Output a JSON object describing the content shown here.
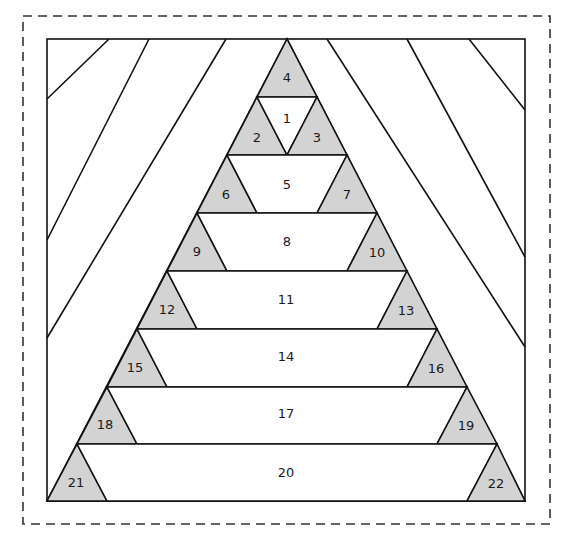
{
  "diagram": {
    "colors": {
      "shaded": "#d3d3d3",
      "line": "#111111",
      "background": "#ffffff",
      "dashed_border": "#333333"
    },
    "seam_allowance_border": "dashed",
    "pieces": {
      "p1": "1",
      "p2": "2",
      "p3": "3",
      "p4": "4",
      "p5": "5",
      "p6": "6",
      "p7": "7",
      "p8": "8",
      "p9": "9",
      "p10": "10",
      "p11": "11",
      "p12": "12",
      "p13": "13",
      "p14": "14",
      "p15": "15",
      "p16": "16",
      "p17": "17",
      "p18": "18",
      "p19": "19",
      "p20": "20",
      "p21": "21",
      "p22": "22"
    },
    "shaded_pieces": [
      "2",
      "3",
      "4",
      "6",
      "7",
      "9",
      "10",
      "12",
      "13",
      "15",
      "16",
      "18",
      "19",
      "21",
      "22"
    ],
    "unshaded_pieces": [
      "1",
      "5",
      "8",
      "11",
      "14",
      "17",
      "20"
    ],
    "background_strips": {
      "left_count": 4,
      "right_count": 4
    }
  }
}
